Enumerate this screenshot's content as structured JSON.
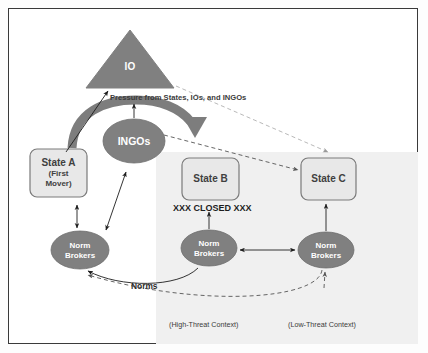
{
  "figure": {
    "border_color": "#3a3a3a",
    "background": "#ffffff",
    "shaded_region_color": "#f0f0f0",
    "shape_fill": "#808080",
    "shape_text_color": "#ffffff",
    "state_box_fill": "#e8e8e8",
    "state_box_stroke": "#7a7a7a",
    "arc_arrow_color": "#7d7d7d"
  },
  "nodes": {
    "io": {
      "label": "IO",
      "shape": "triangle"
    },
    "ingos": {
      "label": "INGOs",
      "shape": "ellipse"
    },
    "state_a": {
      "line1": "State A",
      "line2": "(First",
      "line3": "Mover)",
      "shape": "rounded-rect"
    },
    "state_b": {
      "line1": "State B",
      "shape": "rounded-rect"
    },
    "state_c": {
      "line1": "State C",
      "shape": "rounded-rect"
    },
    "norm_brokers_a": {
      "line1": "Norm",
      "line2": "Brokers",
      "shape": "ellipse"
    },
    "norm_brokers_b": {
      "line1": "Norm",
      "line2": "Brokers",
      "shape": "ellipse"
    },
    "norm_brokers_c": {
      "line1": "Norm",
      "line2": "Brokers",
      "shape": "ellipse"
    }
  },
  "annotations": {
    "pressure": "Pressure from States, IOs, and INGOs",
    "closed": "XXX CLOSED XXX",
    "norms": "Norms",
    "high_threat": "(High-Threat Context)",
    "low_threat": "(Low-Threat Context)"
  }
}
